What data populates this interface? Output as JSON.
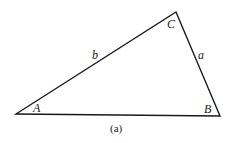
{
  "figure": {
    "caption": "(a)",
    "vertices": {
      "A": {
        "label": "A",
        "x": 16,
        "y": 114
      },
      "B": {
        "label": "B",
        "x": 220,
        "y": 116
      },
      "C": {
        "label": "C",
        "x": 176,
        "y": 12
      }
    },
    "sides": {
      "a": {
        "label": "a"
      },
      "b": {
        "label": "b"
      }
    },
    "line_color": "#1a1a1a"
  }
}
